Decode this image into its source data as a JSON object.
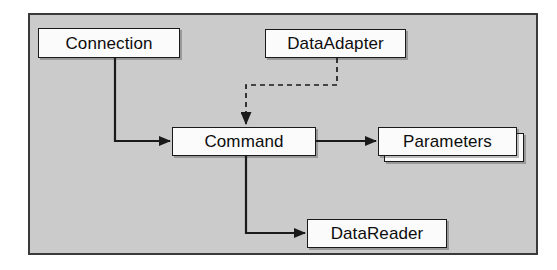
{
  "diagram": {
    "panel": {
      "background_color": "#cbcbcb",
      "border_color": "#3a3a3a"
    },
    "node_style": {
      "fill_color": "#fbfbfb",
      "border_color": "#1a1a1a",
      "text_color": "#0d0d0d"
    },
    "nodes": [
      {
        "id": "connection",
        "label": "Connection",
        "shape": "rectangle"
      },
      {
        "id": "dataadapter",
        "label": "DataAdapter",
        "shape": "rectangle"
      },
      {
        "id": "command",
        "label": "Command",
        "shape": "rectangle"
      },
      {
        "id": "parameters",
        "label": "Parameters",
        "shape": "stacked-rectangle"
      },
      {
        "id": "datareader",
        "label": "DataReader",
        "shape": "rectangle"
      }
    ],
    "edges": [
      {
        "id": "connection-to-command",
        "from": "connection",
        "to": "command",
        "style": "solid",
        "arrow": "filled-triangle",
        "routing": "orthogonal"
      },
      {
        "id": "dataadapter-to-command",
        "from": "dataadapter",
        "to": "command",
        "style": "dashed",
        "arrow": "filled-triangle",
        "routing": "orthogonal"
      },
      {
        "id": "command-to-parameters",
        "from": "command",
        "to": "parameters",
        "style": "solid",
        "arrow": "filled-triangle",
        "routing": "straight"
      },
      {
        "id": "command-to-datareader",
        "from": "command",
        "to": "datareader",
        "style": "solid",
        "arrow": "filled-triangle",
        "routing": "orthogonal"
      }
    ]
  }
}
